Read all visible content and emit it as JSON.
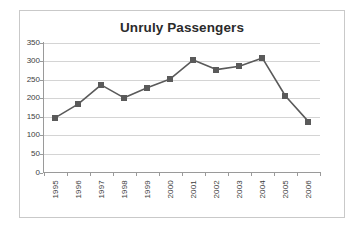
{
  "chart_data": {
    "type": "line",
    "title": "Unruly Passengers",
    "xlabel": "",
    "ylabel": "",
    "categories": [
      "1995",
      "1996",
      "1997",
      "1998",
      "1999",
      "2000",
      "2001",
      "2002",
      "2003",
      "2004",
      "2005",
      "2006"
    ],
    "values": [
      147,
      184,
      236,
      201,
      228,
      252,
      303,
      277,
      286,
      308,
      206,
      137
    ],
    "series": [
      {
        "name": "Unruly Passengers",
        "values": [
          147,
          184,
          236,
          201,
          228,
          252,
          303,
          277,
          286,
          308,
          206,
          137
        ]
      }
    ],
    "ylim": [
      0,
      350
    ],
    "y_ticks": [
      "0",
      "50",
      "100",
      "150",
      "200",
      "250",
      "300",
      "350"
    ],
    "y_tick_values": [
      0,
      50,
      100,
      150,
      200,
      250,
      300,
      350
    ],
    "grid": true,
    "legend": false,
    "legend_position": "none",
    "marker": "square",
    "series_color": "#5a5a5a",
    "grid_color": "#d4d4d4",
    "axis_color": "#9a9a9a",
    "title_color": "#2b2b2b",
    "plot_background": "#ffffff"
  }
}
